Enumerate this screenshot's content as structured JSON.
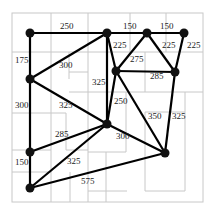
{
  "diagram": {
    "type": "weighted-graph-over-floorplan",
    "nodes": [
      {
        "id": "A",
        "x": 30,
        "y": 33
      },
      {
        "id": "B",
        "x": 107,
        "y": 33
      },
      {
        "id": "C",
        "x": 147,
        "y": 33
      },
      {
        "id": "D",
        "x": 184,
        "y": 33
      },
      {
        "id": "E",
        "x": 30,
        "y": 79
      },
      {
        "id": "F",
        "x": 116,
        "y": 71
      },
      {
        "id": "G",
        "x": 175,
        "y": 72
      },
      {
        "id": "H",
        "x": 107,
        "y": 124
      },
      {
        "id": "I",
        "x": 30,
        "y": 152
      },
      {
        "id": "J",
        "x": 165,
        "y": 153
      },
      {
        "id": "K",
        "x": 30,
        "y": 188
      }
    ],
    "edges": [
      {
        "from": "A",
        "to": "B",
        "weight": "250",
        "lx": 60,
        "ly": 29
      },
      {
        "from": "B",
        "to": "C",
        "weight": "150",
        "lx": 123,
        "ly": 29
      },
      {
        "from": "C",
        "to": "D",
        "weight": "150",
        "lx": 160,
        "ly": 29
      },
      {
        "from": "A",
        "to": "E",
        "weight": "175",
        "lx": 15,
        "ly": 63
      },
      {
        "from": "E",
        "to": "B",
        "weight": "300",
        "lx": 59,
        "ly": 68
      },
      {
        "from": "B",
        "to": "F",
        "weight": "225",
        "lx": 113,
        "ly": 48
      },
      {
        "from": "C",
        "to": "F",
        "weight": "275",
        "lx": 130,
        "ly": 62
      },
      {
        "from": "C",
        "to": "G",
        "weight": "225",
        "lx": 162,
        "ly": 48
      },
      {
        "from": "D",
        "to": "G",
        "weight": "225",
        "lx": 187,
        "ly": 48
      },
      {
        "from": "F",
        "to": "G",
        "weight": "285",
        "lx": 150,
        "ly": 79
      },
      {
        "from": "B",
        "to": "H",
        "weight": "325",
        "lx": 92,
        "ly": 85
      },
      {
        "from": "E",
        "to": "H",
        "weight": "325",
        "lx": 59,
        "ly": 108
      },
      {
        "from": "F",
        "to": "H",
        "weight": "250",
        "lx": 114,
        "ly": 104
      },
      {
        "from": "E",
        "to": "I",
        "weight": "300",
        "lx": 15,
        "ly": 108
      },
      {
        "from": "I",
        "to": "H",
        "weight": "285",
        "lx": 55,
        "ly": 137
      },
      {
        "from": "H",
        "to": "J",
        "weight": "300",
        "lx": 116,
        "ly": 139
      },
      {
        "from": "F",
        "to": "J",
        "weight": "350",
        "lx": 148,
        "ly": 119
      },
      {
        "from": "G",
        "to": "J",
        "weight": "325",
        "lx": 172,
        "ly": 119
      },
      {
        "from": "I",
        "to": "K",
        "weight": "150",
        "lx": 15,
        "ly": 165
      },
      {
        "from": "K",
        "to": "H",
        "weight": "325",
        "lx": 67,
        "ly": 164
      },
      {
        "from": "K",
        "to": "J",
        "weight": "575",
        "lx": 81,
        "ly": 184
      }
    ]
  }
}
